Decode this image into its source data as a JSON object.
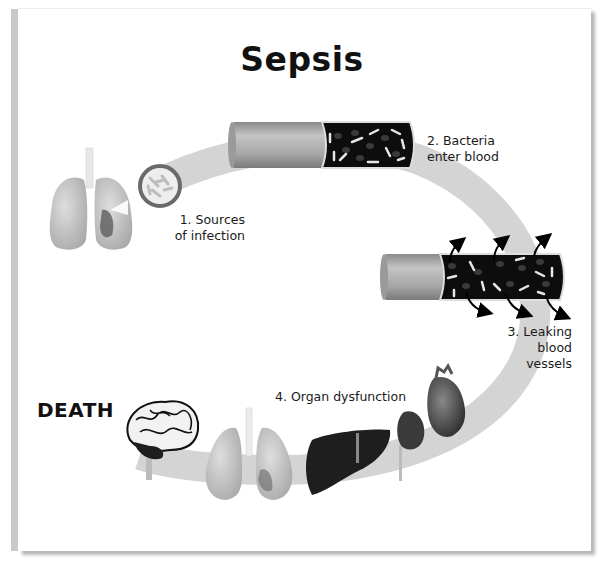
{
  "title": "Sepsis",
  "steps": [
    {
      "label_lines": [
        "1. Sources",
        "of infection"
      ]
    },
    {
      "label_lines": [
        "2. Bacteria",
        "enter blood"
      ]
    },
    {
      "label_lines": [
        "3. Leaking",
        "blood",
        "vessels"
      ]
    },
    {
      "label_lines": [
        "4. Organ dysfunction"
      ]
    }
  ],
  "outcome": "DEATH",
  "colors": {
    "arc": "#d4d4d4",
    "vessel_wall": "#9a9a9a",
    "vessel_interior": "#0d0d0d",
    "organ_dark": "#1e1e1e",
    "lung": "#cfcfcf",
    "frame_bar": "#c9c9c9"
  },
  "icons": [
    "lungs-icon",
    "bacteria-circle-icon",
    "blood-vessel-icon",
    "leaking-vessel-icon",
    "brain-icon",
    "liver-icon",
    "kidney-icon",
    "heart-icon"
  ]
}
